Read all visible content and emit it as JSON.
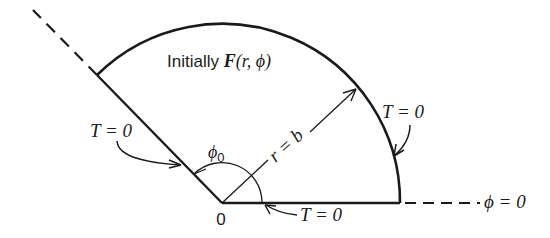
{
  "diagram": {
    "title_label": {
      "prefix": "Initially ",
      "func": "F",
      "args": "(r, ϕ)"
    },
    "labels": {
      "left_boundary": "T = 0",
      "arc_boundary": "T = 0",
      "bottom_boundary": "T = 0",
      "origin": "0",
      "radius": "r = b",
      "angle": "ϕ",
      "angle_sub": "0",
      "axis": "ϕ = 0"
    },
    "geometry": {
      "origin": [
        222,
        203
      ],
      "radius": 178,
      "wedge_angle_deg": 134,
      "line_color": "#1a1a1a",
      "background": "#ffffff"
    }
  }
}
